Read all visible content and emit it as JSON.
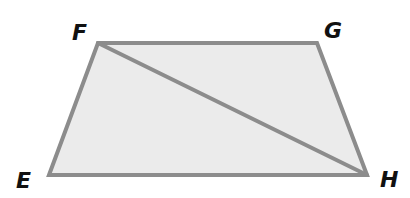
{
  "diagram": {
    "type": "trapezoid-with-diagonal",
    "colors": {
      "fill": "#ebebeb",
      "stroke": "#8c8c8c",
      "label": "#111111"
    },
    "vertices": [
      {
        "name": "E",
        "label": "E",
        "x": 49,
        "y": 175,
        "lx": 16,
        "ly": 188
      },
      {
        "name": "F",
        "label": "F",
        "x": 98,
        "y": 43,
        "lx": 72,
        "ly": 40
      },
      {
        "name": "G",
        "label": "G",
        "x": 317,
        "y": 43,
        "lx": 324,
        "ly": 38
      },
      {
        "name": "H",
        "label": "H",
        "x": 367,
        "y": 175,
        "lx": 380,
        "ly": 187
      }
    ],
    "segments": [
      "EF",
      "FG",
      "GH",
      "HE",
      "FH"
    ],
    "diagonal": "FH"
  }
}
